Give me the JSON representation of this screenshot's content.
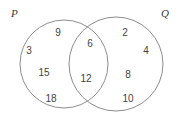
{
  "figure": {
    "type": "venn-diagram",
    "sets": [
      {
        "id": "P",
        "label": "P",
        "position": "top-left"
      },
      {
        "id": "Q",
        "label": "Q",
        "position": "top-right"
      }
    ],
    "stroke_color": "#8d8d8d",
    "fill_color": "#ffffff",
    "text_color": "#3f3f3f",
    "background_color": "#ffffff"
  },
  "regions": {
    "p_only": {
      "name": "P only",
      "values": [
        9,
        3,
        15,
        18
      ]
    },
    "intersection": {
      "name": "P and Q",
      "values": [
        6,
        12
      ]
    },
    "q_only": {
      "name": "Q only",
      "values": [
        2,
        4,
        8,
        10
      ]
    }
  },
  "numbers": [
    {
      "value": "9",
      "region": "p_only",
      "x": 58,
      "y": 33
    },
    {
      "value": "3",
      "region": "p_only",
      "x": 29,
      "y": 51
    },
    {
      "value": "15",
      "region": "p_only",
      "x": 44,
      "y": 73
    },
    {
      "value": "18",
      "region": "p_only",
      "x": 51,
      "y": 99
    },
    {
      "value": "6",
      "region": "intersection",
      "x": 90,
      "y": 44
    },
    {
      "value": "12",
      "region": "intersection",
      "x": 86,
      "y": 79
    },
    {
      "value": "2",
      "region": "q_only",
      "x": 125,
      "y": 33
    },
    {
      "value": "4",
      "region": "q_only",
      "x": 146,
      "y": 51
    },
    {
      "value": "8",
      "region": "q_only",
      "x": 128,
      "y": 75
    },
    {
      "value": "10",
      "region": "q_only",
      "x": 128,
      "y": 99
    }
  ],
  "geometry": {
    "circle_p": {
      "cx": 64,
      "cy": 64,
      "r": 44
    },
    "circle_q": {
      "cx": 116,
      "cy": 64,
      "r": 47
    }
  }
}
